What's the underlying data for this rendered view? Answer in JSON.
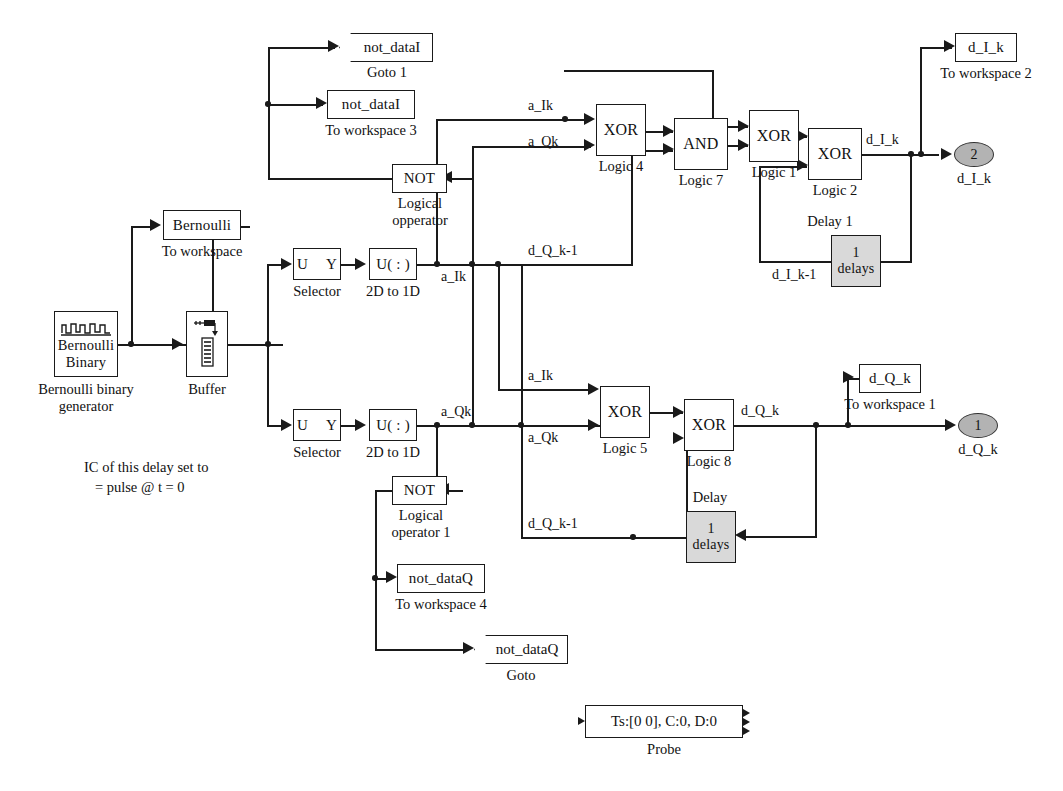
{
  "diagram": {
    "accent_gray": "#d9d9d9",
    "port_gray": "#b3b3b3",
    "wire_color": "#1a1a1a"
  },
  "blocks": {
    "bernoulli_source": {
      "label": "Bernoulli\nBinary",
      "caption": "Bernoulli binary\ngenerator",
      "icon": "pulse-waveform-icon"
    },
    "to_workspace_bernoulli": {
      "label": "Bernoulli",
      "caption": "To workspace"
    },
    "buffer": {
      "label": "",
      "caption": "Buffer",
      "icon": "buffer-tank-icon"
    },
    "selector_i": {
      "label": "U     Y",
      "caption": "Selector"
    },
    "selector_q": {
      "label": "U     Y",
      "caption": "Selector"
    },
    "reshape_i": {
      "label": "U( : )",
      "caption": "2D to 1D"
    },
    "reshape_q": {
      "label": "U( : )",
      "caption": "2D to 1D"
    },
    "not_i": {
      "label": "NOT",
      "caption": "Logical\nopperator"
    },
    "not_q": {
      "label": "NOT",
      "caption": "Logical\noperator 1"
    },
    "goto_i": {
      "label": "not_dataI",
      "caption": "Goto 1"
    },
    "goto_q": {
      "label": "not_dataQ",
      "caption": "Goto"
    },
    "to_workspace_3": {
      "label": "not_dataI",
      "caption": "To workspace 3"
    },
    "to_workspace_4": {
      "label": "not_dataQ",
      "caption": "To workspace 4"
    },
    "logic4": {
      "label": "XOR",
      "caption": "Logic 4"
    },
    "logic7": {
      "label": "AND",
      "caption": "Logic 7"
    },
    "logic1": {
      "label": "XOR",
      "caption": "Logic 1"
    },
    "logic2": {
      "label": "XOR",
      "caption": "Logic 2"
    },
    "logic5": {
      "label": "XOR",
      "caption": "Logic 5"
    },
    "logic8": {
      "label": "XOR",
      "caption": "Logic 8"
    },
    "delay1": {
      "label": "1\ndelays",
      "caption": "Delay 1"
    },
    "delay": {
      "label": "1\ndelays",
      "caption": "Delay"
    },
    "to_workspace_2": {
      "label": "d_I_k",
      "caption": "To workspace 2"
    },
    "to_workspace_1": {
      "label": "d_Q_k",
      "caption": "To workspace 1"
    },
    "outport_2": {
      "label": "2",
      "caption": "d_I_k"
    },
    "outport_1": {
      "label": "1",
      "caption": "d_Q_k"
    },
    "probe": {
      "label": "Ts:[0 0], C:0, D:0",
      "caption": "Probe"
    }
  },
  "signal_labels": {
    "a_Ik_main": "a_Ik",
    "a_Qk_main": "a_Qk",
    "a_Ik_top": "a_Ik",
    "a_Qk_top": "a_Qk",
    "a_Ik_bot": "a_Ik",
    "a_Qk_bot": "a_Qk",
    "d_Q_k_m1_top": "d_Q_k-1",
    "d_Q_k_m1_bot": "d_Q_k-1",
    "d_I_k": "d_I_k",
    "d_I_k_m1": "d_I_k-1",
    "d_Q_k": "d_Q_k"
  },
  "annotations": {
    "ic_note": "IC of this delay set to\n   = pulse @ t = 0"
  }
}
